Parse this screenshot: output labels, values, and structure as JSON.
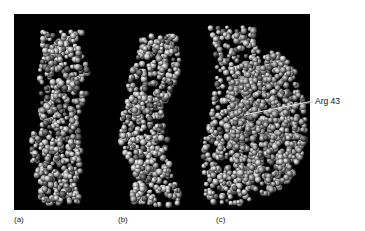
{
  "figure": {
    "panels": [
      {
        "id": "a",
        "label": "(a)",
        "description": "space-filling molecular model, helical strand"
      },
      {
        "id": "b",
        "label": "(b)",
        "description": "space-filling molecular model, curved helical strand"
      },
      {
        "id": "c",
        "label": "(c)",
        "description": "space-filling model of complex with bound protein"
      }
    ],
    "annotation": {
      "text": "Arg 43"
    },
    "colors": {
      "background": "#000000",
      "atoms_light": "#d9d9d9",
      "atoms_mid": "#8a8a8a",
      "atoms_dark": "#3a3a3a",
      "page": "#ffffff"
    }
  }
}
